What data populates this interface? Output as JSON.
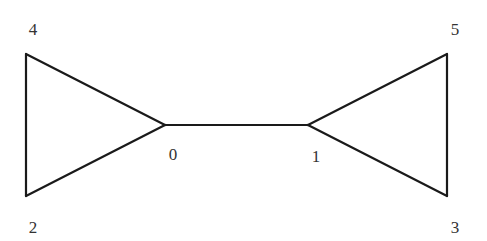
{
  "graph": {
    "nodes": [
      {
        "id": "0",
        "label": "0",
        "x": 165,
        "y": 125,
        "lx": 173,
        "ly": 160
      },
      {
        "id": "1",
        "label": "1",
        "x": 308,
        "y": 125,
        "lx": 316,
        "ly": 162
      },
      {
        "id": "2",
        "label": "2",
        "x": 26,
        "y": 196,
        "lx": 33,
        "ly": 233
      },
      {
        "id": "3",
        "label": "3",
        "x": 447,
        "y": 196,
        "lx": 455,
        "ly": 233
      },
      {
        "id": "4",
        "label": "4",
        "x": 26,
        "y": 54,
        "lx": 33,
        "ly": 35
      },
      {
        "id": "5",
        "label": "5",
        "x": 447,
        "y": 54,
        "lx": 455,
        "ly": 35
      }
    ],
    "edges": [
      [
        "4",
        "0"
      ],
      [
        "4",
        "2"
      ],
      [
        "2",
        "0"
      ],
      [
        "0",
        "1"
      ],
      [
        "1",
        "5"
      ],
      [
        "5",
        "3"
      ],
      [
        "1",
        "3"
      ]
    ],
    "colors": {
      "edge": "#1a1a1a",
      "label": "#333333"
    }
  }
}
